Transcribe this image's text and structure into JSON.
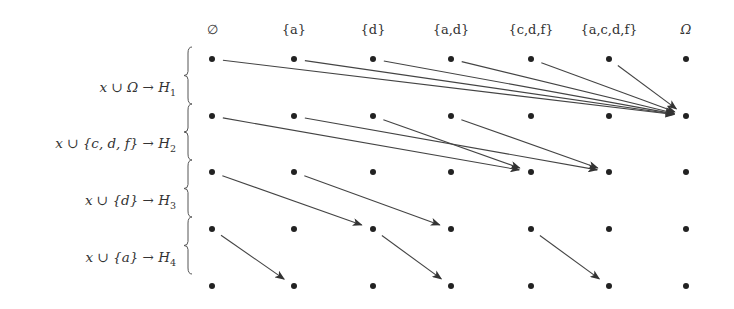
{
  "diagram": {
    "columns": [
      "∅",
      "{a}",
      "{d}",
      "{a,d}",
      "{c,d,f}",
      "{a,c,d,f}",
      "Ω"
    ],
    "row_count": 5,
    "row_labels": [
      {
        "text": "x ∪ Ω → H",
        "sub": "1"
      },
      {
        "text": "x ∪ {c, d, f} → H",
        "sub": "2"
      },
      {
        "text": "x ∪ {d} → H",
        "sub": "3"
      },
      {
        "text": "x ∪ {a} → H",
        "sub": "4"
      }
    ],
    "arrows": [
      {
        "from_row": 0,
        "from_col": 0,
        "to_row": 1,
        "to_col": 6
      },
      {
        "from_row": 0,
        "from_col": 1,
        "to_row": 1,
        "to_col": 6
      },
      {
        "from_row": 0,
        "from_col": 2,
        "to_row": 1,
        "to_col": 6
      },
      {
        "from_row": 0,
        "from_col": 3,
        "to_row": 1,
        "to_col": 6
      },
      {
        "from_row": 0,
        "from_col": 4,
        "to_row": 1,
        "to_col": 6
      },
      {
        "from_row": 0,
        "from_col": 5,
        "to_row": 1,
        "to_col": 6
      },
      {
        "from_row": 1,
        "from_col": 0,
        "to_row": 2,
        "to_col": 4
      },
      {
        "from_row": 1,
        "from_col": 1,
        "to_row": 2,
        "to_col": 5
      },
      {
        "from_row": 1,
        "from_col": 2,
        "to_row": 2,
        "to_col": 4
      },
      {
        "from_row": 1,
        "from_col": 3,
        "to_row": 2,
        "to_col": 5
      },
      {
        "from_row": 2,
        "from_col": 0,
        "to_row": 3,
        "to_col": 2
      },
      {
        "from_row": 2,
        "from_col": 1,
        "to_row": 3,
        "to_col": 3
      },
      {
        "from_row": 3,
        "from_col": 0,
        "to_row": 4,
        "to_col": 1
      },
      {
        "from_row": 3,
        "from_col": 2,
        "to_row": 4,
        "to_col": 3
      },
      {
        "from_row": 3,
        "from_col": 4,
        "to_row": 4,
        "to_col": 5
      }
    ]
  }
}
